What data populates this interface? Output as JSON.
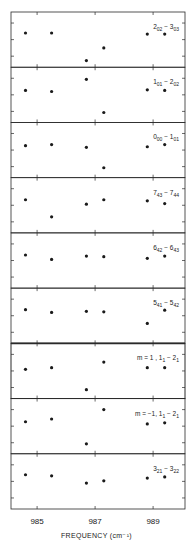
{
  "chart_data": {
    "type": "scatter",
    "title": "",
    "xlabel": "FREQUENCY (cm⁻¹)",
    "ylabel": "",
    "xlim": [
      984.1,
      990.1
    ],
    "xticks": [
      985,
      987,
      989
    ],
    "xtick_labels": [
      "985",
      "987",
      "989"
    ],
    "grid": false,
    "legend": "none",
    "layout": "9 vertically stacked panels sharing x-axis; each panel has 3 inner y tick marks on left and right edges, no y tick labels",
    "x": [
      984.6,
      985.5,
      986.7,
      987.3,
      988.8,
      989.4
    ],
    "panels": [
      {
        "label": "2_02 − 3_03",
        "label_main": [
          "2",
          "3"
        ],
        "label_sub": [
          "02",
          "03"
        ],
        "points": [
          {
            "x": 984.6,
            "y": 0.62
          },
          {
            "x": 985.5,
            "y": 0.62
          },
          {
            "x": 986.7,
            "y": 0.12
          },
          {
            "x": 987.3,
            "y": 0.35
          },
          {
            "x": 988.8,
            "y": 0.6
          },
          {
            "x": 989.4,
            "y": 0.6
          }
        ]
      },
      {
        "label": "1_01 − 2_02",
        "label_main": [
          "1",
          "2"
        ],
        "label_sub": [
          "01",
          "02"
        ],
        "points": [
          {
            "x": 984.6,
            "y": 0.58
          },
          {
            "x": 985.5,
            "y": 0.56
          },
          {
            "x": 986.7,
            "y": 0.78
          },
          {
            "x": 987.3,
            "y": 0.18
          },
          {
            "x": 988.8,
            "y": 0.59
          },
          {
            "x": 989.4,
            "y": 0.58
          }
        ]
      },
      {
        "label": "0_00 − 1_01",
        "label_main": [
          "0",
          "1"
        ],
        "label_sub": [
          "00",
          "01"
        ],
        "points": [
          {
            "x": 984.6,
            "y": 0.58
          },
          {
            "x": 985.5,
            "y": 0.6
          },
          {
            "x": 986.7,
            "y": 0.55
          },
          {
            "x": 987.3,
            "y": 0.18
          },
          {
            "x": 988.8,
            "y": 0.56
          },
          {
            "x": 989.4,
            "y": 0.6
          }
        ]
      },
      {
        "label": "7_43 − 7_44",
        "label_main": [
          "7",
          "7"
        ],
        "label_sub": [
          "43",
          "44"
        ],
        "points": [
          {
            "x": 984.6,
            "y": 0.6
          },
          {
            "x": 985.5,
            "y": 0.29
          },
          {
            "x": 986.7,
            "y": 0.52
          },
          {
            "x": 987.3,
            "y": 0.6
          },
          {
            "x": 988.8,
            "y": 0.58
          },
          {
            "x": 989.4,
            "y": 0.53
          }
        ]
      },
      {
        "label": "6_42 − 6_43",
        "label_main": [
          "6",
          "6"
        ],
        "label_sub": [
          "42",
          "43"
        ],
        "points": [
          {
            "x": 984.6,
            "y": 0.6
          },
          {
            "x": 985.5,
            "y": 0.52
          },
          {
            "x": 986.7,
            "y": 0.58
          },
          {
            "x": 987.3,
            "y": 0.57
          },
          {
            "x": 988.8,
            "y": 0.54
          },
          {
            "x": 989.4,
            "y": 0.58
          }
        ]
      },
      {
        "label": "5_41 − 5_42",
        "label_main": [
          "5",
          "5"
        ],
        "label_sub": [
          "41",
          "42"
        ],
        "points": [
          {
            "x": 984.6,
            "y": 0.61
          },
          {
            "x": 985.5,
            "y": 0.56
          },
          {
            "x": 986.7,
            "y": 0.58
          },
          {
            "x": 987.3,
            "y": 0.57
          },
          {
            "x": 988.8,
            "y": 0.36
          },
          {
            "x": 989.4,
            "y": 0.6
          }
        ]
      },
      {
        "label": "m = 1 , 1_1 − 2_1",
        "label_prefix": "m = 1 ,",
        "label_main": [
          "1",
          "2"
        ],
        "label_sub": [
          "1",
          "1"
        ],
        "points": [
          {
            "x": 984.6,
            "y": 0.53
          },
          {
            "x": 985.5,
            "y": 0.56
          },
          {
            "x": 986.7,
            "y": 0.16
          },
          {
            "x": 987.3,
            "y": 0.66
          },
          {
            "x": 988.8,
            "y": 0.56
          },
          {
            "x": 989.4,
            "y": 0.56
          }
        ]
      },
      {
        "label": "m = −1, 1_1 − 2_1",
        "label_prefix": "m = −1,",
        "label_main": [
          "1",
          "2"
        ],
        "label_sub": [
          "1",
          "1"
        ],
        "points": [
          {
            "x": 984.6,
            "y": 0.58
          },
          {
            "x": 985.5,
            "y": 0.63
          },
          {
            "x": 986.7,
            "y": 0.18
          },
          {
            "x": 987.3,
            "y": 0.8
          },
          {
            "x": 988.8,
            "y": 0.54
          },
          {
            "x": 989.4,
            "y": 0.56
          }
        ]
      },
      {
        "label": "3_21 − 3_22",
        "label_main": [
          "3",
          "3"
        ],
        "label_sub": [
          "21",
          "22"
        ],
        "points": [
          {
            "x": 984.6,
            "y": 0.62
          },
          {
            "x": 985.5,
            "y": 0.6
          },
          {
            "x": 986.7,
            "y": 0.47
          },
          {
            "x": 987.3,
            "y": 0.51
          },
          {
            "x": 988.8,
            "y": 0.56
          },
          {
            "x": 989.4,
            "y": 0.58
          }
        ]
      }
    ]
  },
  "axis": {
    "tick_labels": [
      "985",
      "987",
      "989"
    ],
    "xlabel": "FREQUENCY (cm⁻¹)"
  },
  "colors": {
    "ink": "#1a1a1a",
    "frame": "#2a2a2a",
    "background": "#ffffff"
  }
}
